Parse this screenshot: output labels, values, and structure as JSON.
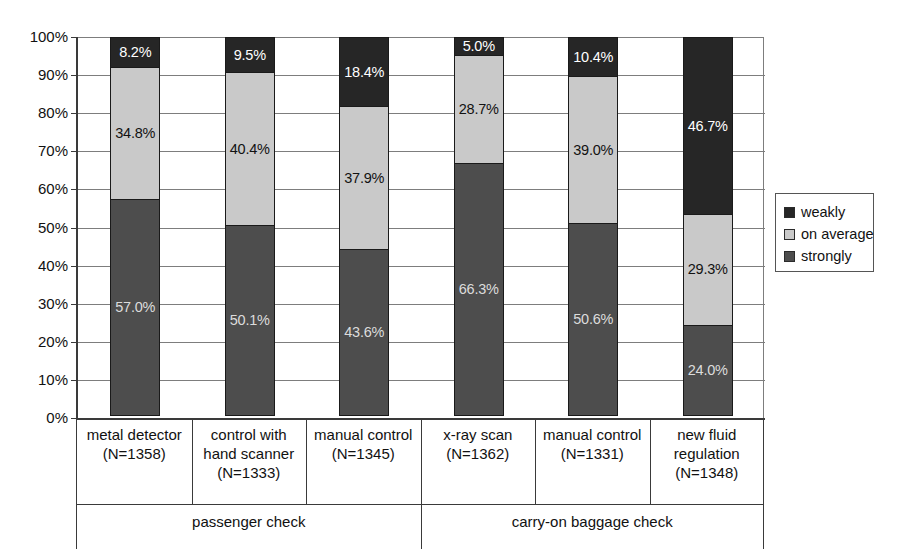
{
  "chart_data": {
    "type": "bar",
    "subtype": "stacked-100-percent",
    "title": "",
    "xlabel": "",
    "ylabel": "",
    "ylim": [
      0,
      100
    ],
    "ytick_labels": [
      "100%",
      "90%",
      "80%",
      "70%",
      "60%",
      "50%",
      "40%",
      "30%",
      "20%",
      "10%",
      "0%"
    ],
    "ytick_values": [
      100,
      90,
      80,
      70,
      60,
      50,
      40,
      30,
      20,
      10,
      0
    ],
    "grid": true,
    "legend_position": "right",
    "categories": [
      "metal detector (N=1358)",
      "control with hand scanner (N=1333)",
      "manual control (N=1345)",
      "x-ray scan (N=1362)",
      "manual control (N=1331)",
      "new fluid regulation (N=1348)"
    ],
    "series": [
      {
        "name": "weakly",
        "color": "#262626",
        "values": [
          8.2,
          9.5,
          18.4,
          5.0,
          10.4,
          46.7
        ]
      },
      {
        "name": "on average",
        "color": "#c9c9c9",
        "values": [
          34.8,
          40.4,
          37.9,
          28.7,
          39.0,
          29.3
        ]
      },
      {
        "name": "strongly",
        "color": "#4d4d4d",
        "values": [
          57.0,
          50.1,
          43.6,
          66.3,
          50.6,
          24.0
        ]
      }
    ],
    "value_labels": [
      [
        "8.2%",
        "34.8%",
        "57.0%"
      ],
      [
        "9.5%",
        "40.4%",
        "50.1%"
      ],
      [
        "18.4%",
        "37.9%",
        "43.6%"
      ],
      [
        "5.0%",
        "28.7%",
        "66.3%"
      ],
      [
        "10.4%",
        "39.0%",
        "50.6%"
      ],
      [
        "46.7%",
        "29.3%",
        "24.0%"
      ]
    ],
    "groups": [
      {
        "label": "passenger check",
        "categories": [
          0,
          1,
          2
        ]
      },
      {
        "label": "carry-on baggage check",
        "categories": [
          3,
          4,
          5
        ]
      }
    ]
  },
  "axis": {
    "yticks": [
      {
        "label": "100%",
        "value": 100
      },
      {
        "label": "90%",
        "value": 90
      },
      {
        "label": "80%",
        "value": 80
      },
      {
        "label": "70%",
        "value": 70
      },
      {
        "label": "60%",
        "value": 60
      },
      {
        "label": "50%",
        "value": 50
      },
      {
        "label": "40%",
        "value": 40
      },
      {
        "label": "30%",
        "value": 30
      },
      {
        "label": "20%",
        "value": 20
      },
      {
        "label": "10%",
        "value": 10
      },
      {
        "label": "0%",
        "value": 0
      }
    ]
  },
  "categories_display": [
    {
      "line1": "metal detector",
      "line2": "(N=1358)",
      "line3": ""
    },
    {
      "line1": "control with",
      "line2": "hand scanner",
      "line3": "(N=1333)"
    },
    {
      "line1": "manual control",
      "line2": "(N=1345)",
      "line3": ""
    },
    {
      "line1": "x-ray scan",
      "line2": "(N=1362)",
      "line3": ""
    },
    {
      "line1": "manual control",
      "line2": "(N=1331)",
      "line3": ""
    },
    {
      "line1": "new fluid",
      "line2": "regulation",
      "line3": "(N=1348)"
    }
  ],
  "groups_display": [
    {
      "label": "passenger check"
    },
    {
      "label": "carry-on baggage check"
    }
  ],
  "legend": {
    "items": [
      {
        "label": "weakly",
        "color": "#262626"
      },
      {
        "label": "on average",
        "color": "#c9c9c9"
      },
      {
        "label": "strongly",
        "color": "#4d4d4d"
      }
    ]
  }
}
